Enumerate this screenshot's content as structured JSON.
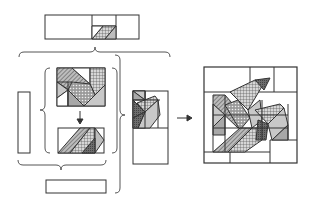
{
  "diagram": {
    "title": "",
    "colors": {
      "stroke": "#333333",
      "light_gray": "#c8c8c8",
      "mid_gray": "#a8a8a8",
      "dark_gray": "#7a7a7a",
      "background": "#ffffff"
    },
    "components": [
      {
        "id": "top-strip",
        "label": "Top row strip with small square and diagonal unit"
      },
      {
        "id": "left-strip",
        "label": "Left vertical plain strip"
      },
      {
        "id": "upper-unit",
        "label": "Upper leaf unit with patterned diagonals"
      },
      {
        "id": "lower-unit",
        "label": "Lower stem unit with diagonal"
      },
      {
        "id": "bottom-strip",
        "label": "Bottom plain strip"
      },
      {
        "id": "side-column",
        "label": "Side column of half-square triangles"
      },
      {
        "id": "finished-block",
        "label": "Finished leaf quilt block"
      }
    ],
    "arrows": [
      {
        "from": "upper-unit",
        "to": "lower-unit",
        "direction": "down"
      },
      {
        "from": "side-column",
        "to": "finished-block",
        "direction": "right"
      }
    ],
    "braces": [
      {
        "id": "top-brace",
        "orientation": "horizontal"
      },
      {
        "id": "inner-left-brace",
        "orientation": "vertical"
      },
      {
        "id": "inner-right-brace",
        "orientation": "vertical"
      },
      {
        "id": "mid-bottom-brace",
        "orientation": "horizontal"
      },
      {
        "id": "outer-right-brace",
        "orientation": "vertical"
      }
    ]
  }
}
